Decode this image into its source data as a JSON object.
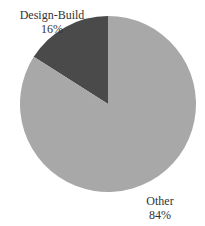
{
  "chart_data": {
    "type": "pie",
    "title": "",
    "slices": [
      {
        "label": "Design-Build",
        "value": 16,
        "display": "16%",
        "color": "#4a4a4a"
      },
      {
        "label": "Other",
        "value": 84,
        "display": "84%",
        "color": "#a8a8a8"
      }
    ],
    "start_angle_deg": 0,
    "direction": "counterclockwise-first-slice",
    "legend": "none (direct labels)"
  },
  "labels": {
    "design_build": {
      "name": "Design-Build",
      "pct": "16%"
    },
    "other": {
      "name": "Other",
      "pct": "84%"
    }
  }
}
